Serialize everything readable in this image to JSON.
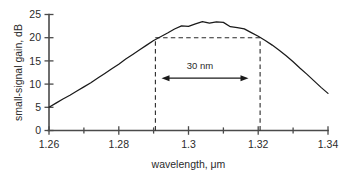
{
  "chart_data": {
    "type": "line",
    "title": "",
    "subtitle": "",
    "xlabel": "wavelength, μm",
    "ylabel": "small-signal gain, dB",
    "xlim": [
      1.26,
      1.34
    ],
    "ylim": [
      0,
      25
    ],
    "grid": false,
    "legend_position": "none",
    "xticks": [
      1.26,
      1.27,
      1.28,
      1.29,
      1.3,
      1.31,
      1.32,
      1.33,
      1.34
    ],
    "xtick_labels": [
      "1.26",
      "",
      "1.28",
      "",
      "1.3",
      "",
      "1.32",
      "",
      "1.34"
    ],
    "xtick_labels_major": [
      "1.26",
      "1.28",
      "1.3",
      "1.32",
      "1.34"
    ],
    "xtick_major_values": [
      1.26,
      1.28,
      1.3,
      1.32,
      1.34
    ],
    "xtick_minor_values": [
      1.27,
      1.29,
      1.31,
      1.33
    ],
    "yticks": [
      0,
      5,
      10,
      15,
      20,
      25
    ],
    "ytick_labels": [
      "0",
      "5",
      "10",
      "15",
      "20",
      "25"
    ],
    "series": [
      {
        "name": "small-signal gain",
        "x": [
          1.26,
          1.262,
          1.264,
          1.266,
          1.268,
          1.27,
          1.272,
          1.274,
          1.276,
          1.278,
          1.28,
          1.282,
          1.284,
          1.286,
          1.288,
          1.29,
          1.292,
          1.294,
          1.296,
          1.298,
          1.3,
          1.302,
          1.304,
          1.306,
          1.308,
          1.31,
          1.312,
          1.314,
          1.316,
          1.318,
          1.32,
          1.322,
          1.324,
          1.326,
          1.328,
          1.33,
          1.332,
          1.334,
          1.336,
          1.338,
          1.34
        ],
        "y": [
          5.0,
          5.9,
          6.8,
          7.6,
          8.5,
          9.4,
          10.3,
          11.3,
          12.3,
          13.3,
          14.3,
          15.4,
          16.4,
          17.4,
          18.4,
          19.4,
          20.2,
          21.0,
          21.7,
          22.3,
          22.8,
          23.1,
          23.3,
          23.3,
          23.2,
          23.0,
          22.7,
          22.3,
          21.8,
          21.1,
          20.3,
          19.4,
          18.4,
          17.3,
          16.1,
          14.8,
          13.4,
          12.1,
          10.7,
          9.3,
          8.0
        ]
      }
    ],
    "annotations": [
      {
        "name": "bandwidth-label",
        "text": "30 nm",
        "x": 1.3055,
        "y": 13.5
      },
      {
        "name": "bandwidth-arrow",
        "text": "",
        "x_start": 1.2925,
        "x_end": 1.3188,
        "y": 11.3,
        "style": "double-headed-arrow"
      },
      {
        "name": "gain-level-guide",
        "text": "",
        "y": 20,
        "x_start": 1.2908,
        "x_end": 1.3208,
        "style": "horizontal-dashed"
      },
      {
        "name": "bandwidth-edge-left-guide",
        "text": "",
        "x": 1.2908,
        "y_start": 0,
        "y_end": 20,
        "style": "vertical-dashed"
      },
      {
        "name": "bandwidth-edge-right-guide",
        "text": "",
        "x": 1.3208,
        "y_start": 0,
        "y_end": 20,
        "style": "vertical-dashed"
      }
    ],
    "peak": {
      "x": 1.305,
      "y": 23.3
    },
    "bandwidth_nm": 30,
    "gain_at_band_edges_dB": 20
  },
  "colors": {
    "curve": "#1a1a1a",
    "axis": "#4a4a4a",
    "text": "#2b2b2b",
    "guide": "#2a2a2a",
    "background": "#ffffff"
  },
  "axis_labels": {
    "x_title": "wavelength, μm",
    "y_title": "small-signal gain, dB"
  },
  "xtick_text": {
    "t0": "1.26",
    "t1": "1.28",
    "t2": "1.3",
    "t3": "1.32",
    "t4": "1.34"
  },
  "ytick_text": {
    "t0": "0",
    "t1": "5",
    "t2": "10",
    "t3": "15",
    "t4": "20",
    "t5": "25"
  },
  "annotation_text": {
    "bandwidth": "30 nm"
  }
}
